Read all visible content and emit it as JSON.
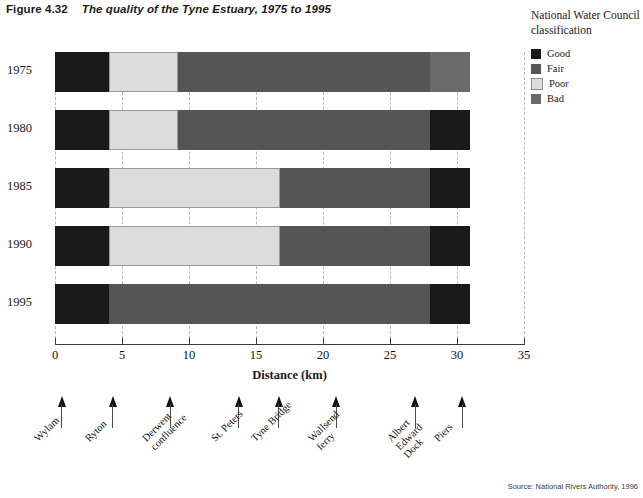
{
  "figure": {
    "number": "Figure 4.32",
    "caption": "The quality of the Tyne Estuary, 1975 to 1995"
  },
  "legend": {
    "title_line1": "National Water Council",
    "title_line2": "classification",
    "items": [
      {
        "label": "Good",
        "color": "#1a1a1a"
      },
      {
        "label": "Fair",
        "color": "#555555"
      },
      {
        "label": "Poor",
        "color": "#dcdcdc"
      },
      {
        "label": "Bad",
        "color": "#6b6b6b"
      }
    ]
  },
  "source": "Source: National Rivers Authority, 1996",
  "places": [
    {
      "name": "Wylam",
      "km": 0.5,
      "lines": [
        "Wylam"
      ]
    },
    {
      "name": "Ryton",
      "km": 4.3,
      "lines": [
        "Ryton"
      ]
    },
    {
      "name": "Derwent confluence",
      "km": 8.6,
      "lines": [
        "Derwent",
        "confluence"
      ]
    },
    {
      "name": "St. Peters",
      "km": 13.7,
      "lines": [
        "St. Peters"
      ]
    },
    {
      "name": "Tyne Bridge",
      "km": 16.7,
      "lines": [
        "Tyne Bridge"
      ]
    },
    {
      "name": "Wallsend ferry",
      "km": 21.0,
      "lines": [
        "Wallsend",
        "ferry"
      ]
    },
    {
      "name": "Albert Edward Dock",
      "km": 26.9,
      "lines": [
        "Albert",
        "Edward",
        "Dock"
      ]
    },
    {
      "name": "Piers",
      "km": 30.4,
      "lines": [
        "Piers"
      ]
    }
  ],
  "chart_data": {
    "type": "bar",
    "orientation": "horizontal",
    "stacked": true,
    "title": "The quality of the Tyne Estuary, 1975 to 1995",
    "xlabel": "Distance (km)",
    "ylabel": "Year",
    "xlim": [
      0,
      35
    ],
    "xticks": [
      0,
      5,
      10,
      15,
      20,
      25,
      30,
      35
    ],
    "xtick_labels": [
      "0",
      "5",
      "10",
      "15",
      "20",
      "25",
      "30",
      "35"
    ],
    "grid": "vertical-dashed",
    "legend_position": "top-right",
    "categories": [
      "1975",
      "1980",
      "1985",
      "1990",
      "1995"
    ],
    "series": [
      {
        "name": "Good",
        "color": "#1a1a1a"
      },
      {
        "name": "Fair",
        "color": "#555555"
      },
      {
        "name": "Poor",
        "color": "#dcdcdc"
      },
      {
        "name": "Bad",
        "color": "#6b6b6b"
      }
    ],
    "bars": [
      {
        "year": "1975",
        "segments": [
          {
            "class": "Good",
            "start": 0.0,
            "end": 4.0,
            "color": "#1a1a1a"
          },
          {
            "class": "Poor",
            "start": 4.0,
            "end": 9.2,
            "color": "#dcdcdc"
          },
          {
            "class": "Fair",
            "start": 9.2,
            "end": 28.0,
            "color": "#555555"
          },
          {
            "class": "Bad",
            "start": 28.0,
            "end": 31.0,
            "color": "#6b6b6b"
          }
        ]
      },
      {
        "year": "1980",
        "segments": [
          {
            "class": "Good",
            "start": 0.0,
            "end": 4.0,
            "color": "#1a1a1a"
          },
          {
            "class": "Poor",
            "start": 4.0,
            "end": 9.2,
            "color": "#dcdcdc"
          },
          {
            "class": "Fair",
            "start": 9.2,
            "end": 28.0,
            "color": "#555555"
          },
          {
            "class": "Good",
            "start": 28.0,
            "end": 31.0,
            "color": "#1a1a1a"
          }
        ]
      },
      {
        "year": "1985",
        "segments": [
          {
            "class": "Good",
            "start": 0.0,
            "end": 4.0,
            "color": "#1a1a1a"
          },
          {
            "class": "Poor",
            "start": 4.0,
            "end": 16.8,
            "color": "#dcdcdc"
          },
          {
            "class": "Fair",
            "start": 16.8,
            "end": 28.0,
            "color": "#555555"
          },
          {
            "class": "Good",
            "start": 28.0,
            "end": 31.0,
            "color": "#1a1a1a"
          }
        ]
      },
      {
        "year": "1990",
        "segments": [
          {
            "class": "Good",
            "start": 0.0,
            "end": 4.0,
            "color": "#1a1a1a"
          },
          {
            "class": "Poor",
            "start": 4.0,
            "end": 16.8,
            "color": "#dcdcdc"
          },
          {
            "class": "Fair",
            "start": 16.8,
            "end": 28.0,
            "color": "#555555"
          },
          {
            "class": "Good",
            "start": 28.0,
            "end": 31.0,
            "color": "#1a1a1a"
          }
        ]
      },
      {
        "year": "1995",
        "segments": [
          {
            "class": "Good",
            "start": 0.0,
            "end": 4.0,
            "color": "#1a1a1a"
          },
          {
            "class": "Fair",
            "start": 4.0,
            "end": 28.0,
            "color": "#555555"
          },
          {
            "class": "Good",
            "start": 28.0,
            "end": 31.0,
            "color": "#1a1a1a"
          }
        ]
      }
    ]
  }
}
